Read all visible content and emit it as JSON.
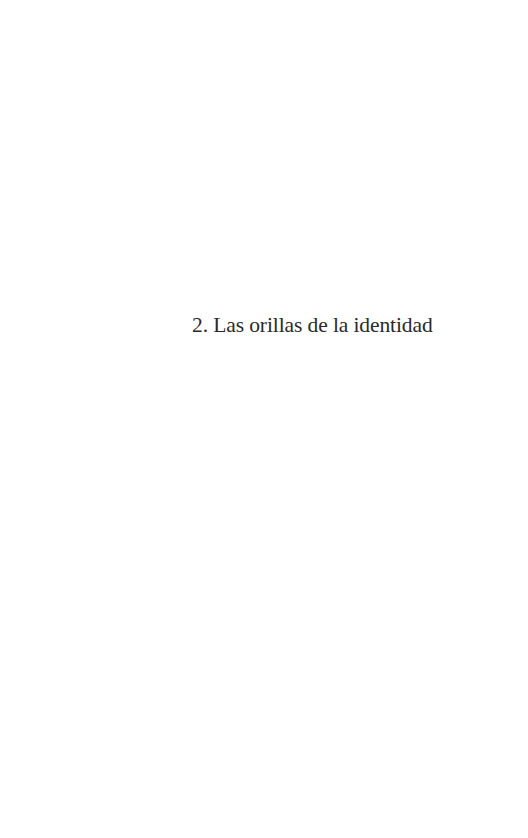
{
  "page": {
    "type": "chapter-title-page",
    "background_color": "#ffffff",
    "text_color": "#2a2a2a"
  },
  "chapter": {
    "number": "2.",
    "title": "Las orillas de la identidad",
    "full_heading": "2. Las orillas de la identidad"
  }
}
